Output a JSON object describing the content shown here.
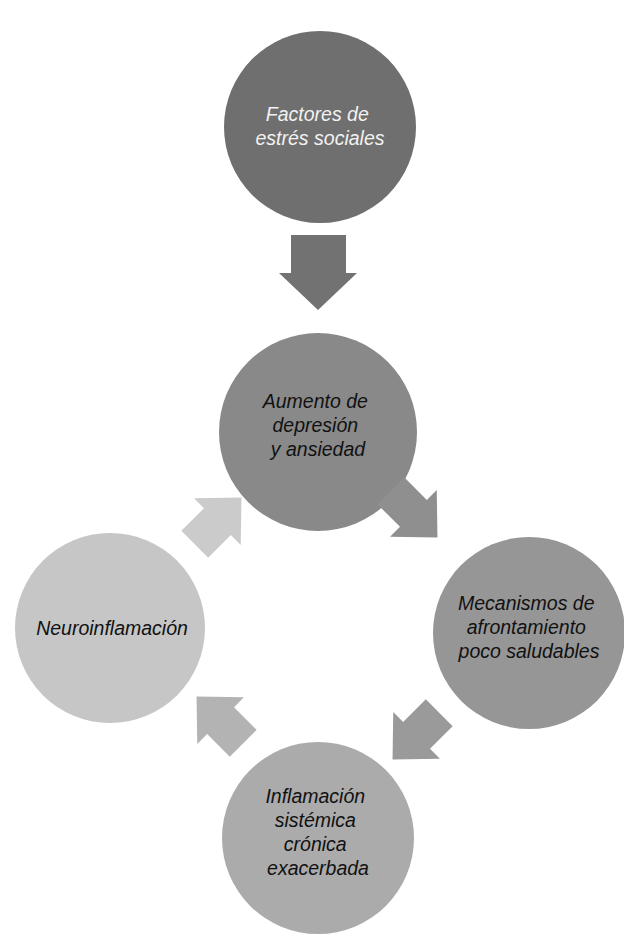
{
  "diagram": {
    "type": "cycle-flow",
    "language": "es",
    "nodes": [
      {
        "id": "stressors",
        "lines": [
          "Factores de",
          "estrés sociales"
        ],
        "color": "#6f6f6f",
        "text_color": "#f2f2f2"
      },
      {
        "id": "depression",
        "lines": [
          "Aumento de",
          "depresión",
          "y ansiedad"
        ],
        "color": "#898989",
        "text_color": "#111111"
      },
      {
        "id": "coping",
        "lines": [
          "Mecanismos de",
          "afrontamiento",
          "poco saludables"
        ],
        "color": "#969696",
        "text_color": "#111111"
      },
      {
        "id": "inflammation",
        "lines": [
          "Inflamación",
          "sistémica",
          "crónica",
          "exacerbada"
        ],
        "color": "#ababab",
        "text_color": "#111111"
      },
      {
        "id": "neuroinflammation",
        "lines": [
          "Neuroinflamación"
        ],
        "color": "#c6c6c6",
        "text_color": "#111111"
      }
    ],
    "arrows": [
      {
        "from": "stressors",
        "to": "depression",
        "direction": "down",
        "color": "#727272"
      },
      {
        "from": "depression",
        "to": "coping",
        "direction": "down-right",
        "color": "#8f8f8f"
      },
      {
        "from": "coping",
        "to": "inflammation",
        "direction": "down-left",
        "color": "#9a9a9a"
      },
      {
        "from": "inflammation",
        "to": "neuroinflammation",
        "direction": "up-left",
        "color": "#b3b3b3"
      },
      {
        "from": "neuroinflammation",
        "to": "depression",
        "direction": "up-right",
        "color": "#cbcbcb"
      }
    ]
  }
}
